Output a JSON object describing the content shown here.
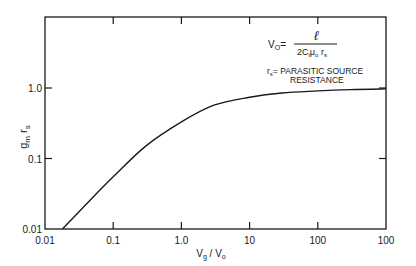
{
  "chart_data": {
    "type": "line",
    "title": "",
    "xlabel": "Vg / V0",
    "ylabel": "gm rs",
    "xscale": "log",
    "yscale": "log",
    "xlim": [
      0.01,
      1000
    ],
    "ylim": [
      0.01,
      10
    ],
    "grid": false,
    "legend": null,
    "x_tick_labels": [
      "0.01",
      "0.1",
      "1.0",
      "10",
      "100",
      "100"
    ],
    "x_tick_values": [
      0.01,
      0.1,
      1.0,
      10,
      100,
      1000
    ],
    "y_tick_labels": [
      "0.01",
      "0.1",
      "1.0"
    ],
    "y_tick_values": [
      0.01,
      0.1,
      1.0
    ],
    "series": [
      {
        "name": "gm rs",
        "x": [
          0.018,
          0.05,
          0.1,
          0.3,
          1.0,
          3.0,
          10,
          30,
          100,
          300,
          1000
        ],
        "y": [
          0.01,
          0.028,
          0.055,
          0.15,
          0.33,
          0.57,
          0.74,
          0.85,
          0.91,
          0.95,
          0.97
        ]
      }
    ],
    "annotations": [
      {
        "text": "V0 = ℓ / (2 Ci μ0 rs)",
        "position": "upper right"
      },
      {
        "text": "rs = PARASITIC SOURCE RESISTANCE",
        "position": "upper right"
      }
    ]
  },
  "labels": {
    "ylabel_main": "g",
    "ylabel_sub1": "m",
    "ylabel_mid": " r",
    "ylabel_sub2": "s",
    "xlabel_main1": "V",
    "xlabel_sub1": "g",
    "xlabel_sep": " / V",
    "xlabel_sub2": "o",
    "formula_lhs": "V",
    "formula_lhs_sub": "O",
    "formula_eq": "=",
    "formula_num": "ℓ",
    "formula_den_a": "2C",
    "formula_den_a_sub": "i",
    "formula_den_b": "μ",
    "formula_den_b_sub": "o",
    "formula_den_c": " r",
    "formula_den_c_sub": "s",
    "def_r": "r",
    "def_r_sub": "s",
    "def_text1": "= PARASITIC SOURCE",
    "def_text2": "RESISTANCE"
  },
  "colors": {
    "ink": "#1a1a1a",
    "background": "#ffffff"
  }
}
